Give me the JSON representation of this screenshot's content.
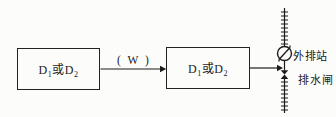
{
  "diagram": {
    "boxes": [
      {
        "id": "left",
        "base1": "D",
        "sub1": "1",
        "base2": "或D",
        "sub2": "2"
      },
      {
        "id": "right",
        "base1": "D",
        "sub1": "1",
        "base2": "或D",
        "sub2": "2"
      }
    ],
    "flow_label": "( W )",
    "station_label": "外排站",
    "gate_label": "排水闸"
  },
  "colors": {
    "ink": "#1b1b1b",
    "paper": "#fcfcfb",
    "box_border": "#222222"
  }
}
